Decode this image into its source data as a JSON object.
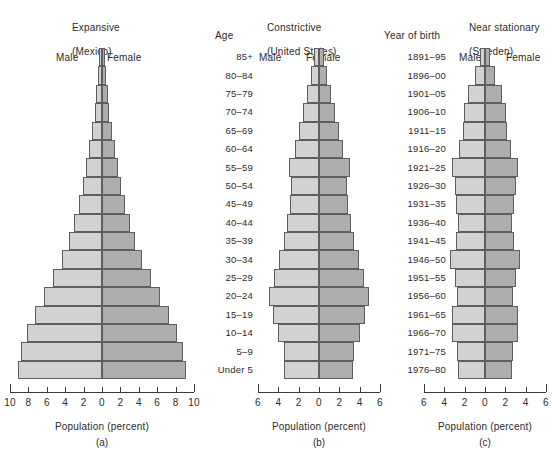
{
  "figure": {
    "caption_axis": "Population (percent)",
    "age_column_header": "Age",
    "year_column_header": "Year of birth",
    "male_label": "Male",
    "female_label": "Female",
    "male_color": "#d2d2d2",
    "female_color": "#adadad",
    "bar_outline_color": "#5e5e5e"
  },
  "age_groups": [
    "85+",
    "80–84",
    "75–79",
    "70–74",
    "65–69",
    "60–64",
    "55–59",
    "50–54",
    "45–49",
    "40–44",
    "35–39",
    "30–34",
    "25–29",
    "20–24",
    "15–19",
    "10–14",
    "5–9",
    "Under 5"
  ],
  "years_of_birth": [
    "1891–95",
    "1896–00",
    "1901–05",
    "1906–10",
    "1911–15",
    "1916–20",
    "1921–25",
    "1926–30",
    "1931–35",
    "1936–40",
    "1941–45",
    "1946–50",
    "1951–55",
    "1956–60",
    "1961–65",
    "1966–70",
    "1971–75",
    "1976–80"
  ],
  "chart_data": [
    {
      "type": "bar",
      "subtype": "population-pyramid",
      "panel": "(a)",
      "title": "Expansive",
      "subtitle": "(Mexico)",
      "xlabel": "Population (percent)",
      "ylabel": "Age",
      "xlim": [
        -10,
        10
      ],
      "xticks": [
        10,
        8,
        6,
        4,
        2,
        0,
        2,
        4,
        6,
        8,
        10
      ],
      "grid": false,
      "categories": [
        "85+",
        "80–84",
        "75–79",
        "70–74",
        "65–69",
        "60–64",
        "55–59",
        "50–54",
        "45–49",
        "40–44",
        "35–39",
        "30–34",
        "25–29",
        "20–24",
        "15–19",
        "10–14",
        "5–9",
        "Under 5"
      ],
      "series": [
        {
          "name": "Male",
          "side": "left",
          "values": [
            0.3,
            0.4,
            0.6,
            0.8,
            1.1,
            1.4,
            1.7,
            2.1,
            2.5,
            3.0,
            3.6,
            4.4,
            5.3,
            6.3,
            7.3,
            8.2,
            8.8,
            9.1
          ]
        },
        {
          "name": "Female",
          "side": "right",
          "values": [
            0.3,
            0.4,
            0.6,
            0.8,
            1.1,
            1.4,
            1.7,
            2.1,
            2.5,
            3.0,
            3.6,
            4.4,
            5.3,
            6.3,
            7.3,
            8.2,
            8.8,
            9.1
          ]
        }
      ]
    },
    {
      "type": "bar",
      "subtype": "population-pyramid",
      "panel": "(b)",
      "title": "Constrictive",
      "subtitle": "(United States)",
      "xlabel": "Population (percent)",
      "ylabel": "Year of birth",
      "xlim": [
        -6,
        6
      ],
      "xticks": [
        6,
        4,
        2,
        0,
        2,
        4,
        6
      ],
      "grid": false,
      "categories": [
        "1891–95",
        "1896–00",
        "1901–05",
        "1906–10",
        "1911–15",
        "1916–20",
        "1921–25",
        "1926–30",
        "1931–35",
        "1936–40",
        "1941–45",
        "1946–50",
        "1951–55",
        "1956–60",
        "1961–65",
        "1966–70",
        "1971–75",
        "1976–80"
      ],
      "series": [
        {
          "name": "Male",
          "side": "left",
          "values": [
            0.5,
            0.8,
            1.2,
            1.6,
            2.0,
            2.4,
            3.0,
            2.8,
            2.9,
            3.1,
            3.4,
            3.9,
            4.4,
            4.9,
            4.5,
            4.0,
            3.4,
            3.4
          ]
        },
        {
          "name": "Female",
          "side": "right",
          "values": [
            0.5,
            0.8,
            1.2,
            1.6,
            2.0,
            2.4,
            3.0,
            2.8,
            2.9,
            3.1,
            3.4,
            3.9,
            4.4,
            4.9,
            4.5,
            4.0,
            3.4,
            3.3
          ]
        }
      ]
    },
    {
      "type": "bar",
      "subtype": "population-pyramid",
      "panel": "(c)",
      "title": "Near stationary",
      "subtitle": "(Sweden)",
      "xlabel": "Population (percent)",
      "ylabel": "Year of birth",
      "xlim": [
        -6,
        6
      ],
      "xticks": [
        6,
        4,
        2,
        0,
        2,
        4,
        6
      ],
      "grid": false,
      "categories": [
        "1891–95",
        "1896–00",
        "1901–05",
        "1906–10",
        "1911–15",
        "1916–20",
        "1921–25",
        "1926–30",
        "1931–35",
        "1936–40",
        "1941–45",
        "1946–50",
        "1951–55",
        "1956–60",
        "1961–65",
        "1966–70",
        "1971–75",
        "1976–80"
      ],
      "series": [
        {
          "name": "Male",
          "side": "left",
          "values": [
            0.5,
            1.0,
            1.7,
            2.1,
            2.2,
            2.6,
            3.2,
            3.0,
            2.9,
            2.7,
            2.9,
            3.4,
            3.0,
            2.8,
            3.2,
            3.2,
            2.8,
            2.7
          ]
        },
        {
          "name": "Female",
          "side": "right",
          "values": [
            0.5,
            1.0,
            1.7,
            2.1,
            2.2,
            2.6,
            3.2,
            3.0,
            2.9,
            2.7,
            2.9,
            3.4,
            3.0,
            2.8,
            3.2,
            3.2,
            2.8,
            2.7
          ]
        }
      ]
    }
  ]
}
